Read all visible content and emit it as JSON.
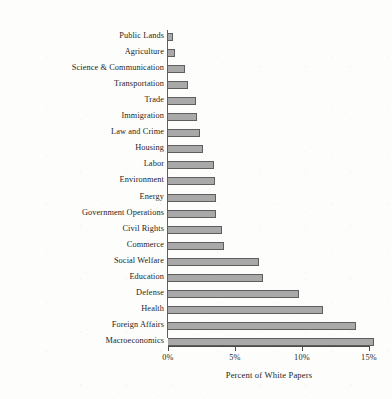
{
  "chart_data": {
    "type": "bar",
    "orientation": "horizontal",
    "title": "",
    "xlabel": "Percent of White Papers",
    "ylabel": "",
    "xlim": [
      0,
      15.4
    ],
    "grid": false,
    "legend": null,
    "bar_color": "#a9a9a9",
    "bar_border_color": "#5e5e5e",
    "axis_color": "#4a4a4a",
    "xticks": [
      0,
      5,
      10,
      15
    ],
    "xtick_labels": [
      "0%",
      "5%",
      "10%",
      "15%"
    ],
    "categories": [
      "Public Lands",
      "Agriculture",
      "Science & Communication",
      "Transportation",
      "Trade",
      "Immigration",
      "Law and Crime",
      "Housing",
      "Labor",
      "Environment",
      "Energy",
      "Government Operations",
      "Civil Rights",
      "Commerce",
      "Social Welfare",
      "Education",
      "Defense",
      "Health",
      "Foreign Affairs",
      "Macroeconomics"
    ],
    "values": [
      0.4,
      0.5,
      1.3,
      1.5,
      2.1,
      2.2,
      2.4,
      2.6,
      3.4,
      3.5,
      3.6,
      3.6,
      4.0,
      4.2,
      6.8,
      7.1,
      9.8,
      11.6,
      14.0,
      15.4
    ]
  }
}
